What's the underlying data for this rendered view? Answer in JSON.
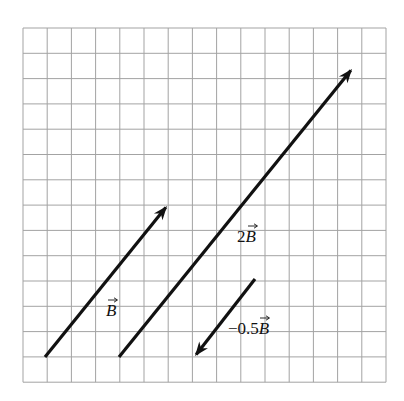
{
  "diagram": {
    "title": "",
    "background": "#ffffff",
    "grid": {
      "x0": 23,
      "y0": 28,
      "cols": 15,
      "rows": 14,
      "cell_w": 24.2,
      "cell_h": 25.3,
      "line_color": "#a3a3a3",
      "line_width": 1
    },
    "arrow_color": "#111111",
    "arrow_width": 3.2,
    "vectors": [
      {
        "id": "B",
        "label_prefix": "",
        "label_symbol": "B",
        "label_text": "B⃗",
        "start": [
          45,
          357
        ],
        "end": [
          167,
          206
        ],
        "label_pos": [
          106,
          316
        ]
      },
      {
        "id": "2B",
        "label_prefix": "2",
        "label_symbol": "B",
        "label_text": "2B⃗",
        "start": [
          119,
          357
        ],
        "end": [
          352,
          69
        ],
        "label_pos": [
          237,
          242
        ]
      },
      {
        "id": "-0.5B",
        "label_prefix": "−0.5",
        "label_symbol": "B",
        "label_text": "−0.5B⃗",
        "start": [
          255,
          279
        ],
        "end": [
          195,
          356
        ],
        "label_pos": [
          228,
          334
        ]
      }
    ]
  }
}
